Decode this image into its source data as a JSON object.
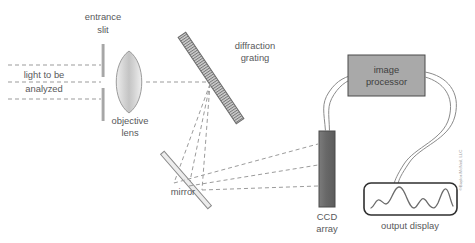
{
  "figure": {
    "background_color": "#ffffff",
    "width": 475,
    "height": 243
  },
  "colors": {
    "label_text": "#58595b",
    "ray_dashed": "#9b9b9b",
    "wire": "#8b8b8b",
    "slit_bar": "#a6a6a6",
    "lens_fill": "#d9d9d9",
    "lens_stroke": "#9b9b9b",
    "grating_fill": "#c9c9c9",
    "grating_stroke": "#6e6e6e",
    "mirror_fill": "#e8e8e8",
    "mirror_stroke": "#8a8a8a",
    "ccd_fill": "#6e6e6e",
    "ccd_stroke": "#4a4a4a",
    "processor_fill": "#a9a9a9",
    "processor_stroke": "#4a4a4a",
    "display_stroke": "#2f2f2f",
    "trace_stroke": "#6b6b6b",
    "copyright_text": "#9a9a9a"
  },
  "labels": {
    "entrance_slit_line1": "entrance",
    "entrance_slit_line2": "slit",
    "light_line1": "light to be",
    "light_line2": "analyzed",
    "objective_lens_line1": "objective",
    "objective_lens_line2": "lens",
    "diffraction_grating_line1": "diffraction",
    "diffraction_grating_line2": "grating",
    "mirror": "mirror",
    "ccd_array_line1": "CCD",
    "ccd_array_line2": "array",
    "image_processor_line1": "image",
    "image_processor_line2": "processor",
    "output_display": "output display",
    "copyright": "©Baylor-McNeil, LLC"
  },
  "components": [
    {
      "id": "entrance-slit",
      "name": "entrance slit",
      "shape": "two vertical bars"
    },
    {
      "id": "objective-lens",
      "name": "objective lens",
      "shape": "biconvex lens"
    },
    {
      "id": "diffraction-grating",
      "name": "diffraction grating",
      "shape": "hatched diagonal bar"
    },
    {
      "id": "mirror",
      "name": "mirror",
      "shape": "thin diagonal bar"
    },
    {
      "id": "ccd-array",
      "name": "CCD array",
      "shape": "vertical dark bar"
    },
    {
      "id": "image-processor",
      "name": "image processor",
      "shape": "gray rectangle"
    },
    {
      "id": "output-display",
      "name": "output display",
      "shape": "rounded rectangle with spectral trace"
    }
  ],
  "light_path": {
    "incoming_rays": 3,
    "dispersed_rays": 3,
    "description": "light to be analyzed passes the entrance slit and objective lens, strikes the diffraction grating, disperses toward the mirror, reflects to the CCD array"
  },
  "signal_path": {
    "from_ccd_to_processor": "wire pair",
    "from_processor_to_display": "wire pair"
  }
}
